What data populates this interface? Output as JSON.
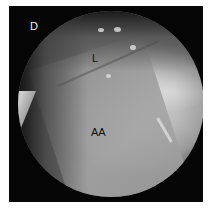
{
  "figure": {
    "panel_letter": "D",
    "labels": {
      "upper": "L",
      "lower": "AA"
    }
  }
}
